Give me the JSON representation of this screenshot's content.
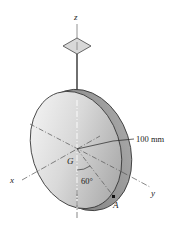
{
  "figure": {
    "axes": {
      "x": "x",
      "y": "y",
      "z": "z"
    },
    "points": {
      "center": "G",
      "edge_point": "A"
    },
    "dimension_label": "100 mm",
    "angle_label": "60°",
    "colors": {
      "disk_face_light": "#f2f2f2",
      "disk_face_dark": "#9a9a9a",
      "disk_rim": "#8a8a8a",
      "support_fill": "#d8d8d8",
      "line": "#333333"
    }
  }
}
